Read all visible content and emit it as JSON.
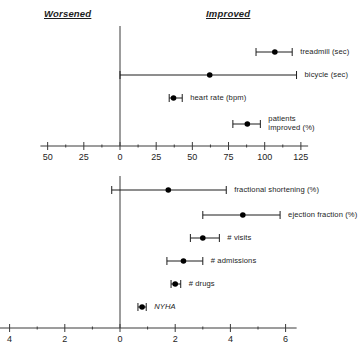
{
  "headers": {
    "worsened": "Worsened",
    "improved": "Improved"
  },
  "chart_data": [
    {
      "type": "scatter",
      "id": "top-panel",
      "title": "",
      "subtitle": "",
      "xlabel": "",
      "ylabel": "",
      "xlim": [
        -55,
        130
      ],
      "grid": false,
      "legend": "none",
      "annotations": [
        "Worsened",
        "Improved"
      ],
      "zero_reference_line": 0,
      "xticks": [
        -50,
        -25,
        0,
        25,
        50,
        75,
        100,
        125
      ],
      "xticklabels": [
        "50",
        "25",
        "0",
        "25",
        "50",
        "75",
        "100",
        "125"
      ],
      "xminorticks": [
        -37.5,
        -12.5,
        12.5,
        37.5,
        62.5,
        87.5,
        112.5
      ],
      "points": [
        {
          "label": "treadmill (sec)",
          "value": 107,
          "ci_low": 94,
          "ci_high": 119
        },
        {
          "label": "bicycle (sec)",
          "value": 62,
          "ci_low": 0,
          "ci_high": 122
        },
        {
          "label": "heart rate (bpm)",
          "value": 37,
          "ci_low": 34,
          "ci_high": 43
        },
        {
          "label": "patients\nimproved (%)",
          "value": 88,
          "ci_low": 78,
          "ci_high": 97
        }
      ]
    },
    {
      "type": "scatter",
      "id": "bottom-panel",
      "title": "",
      "subtitle": "",
      "xlabel": "",
      "ylabel": "",
      "xlim": [
        -4.4,
        6.4
      ],
      "grid": false,
      "legend": "none",
      "annotations": [],
      "zero_reference_line": 0,
      "xticks": [
        -4,
        -2,
        0,
        2,
        4,
        6
      ],
      "xticklabels": [
        "4",
        "2",
        "0",
        "2",
        "4",
        "6"
      ],
      "xminorticks": [
        -3,
        -1,
        1,
        3,
        5
      ],
      "points": [
        {
          "label": "fractional shortening (%)",
          "value": 1.75,
          "ci_low": -0.3,
          "ci_high": 3.85
        },
        {
          "label": "ejection fraction (%)",
          "value": 4.45,
          "ci_low": 3.0,
          "ci_high": 5.8
        },
        {
          "label": "# visits",
          "value": 3.0,
          "ci_low": 2.55,
          "ci_high": 3.6
        },
        {
          "label": "# admissions",
          "value": 2.3,
          "ci_low": 1.7,
          "ci_high": 3.0
        },
        {
          "label": "# drugs",
          "value": 2.0,
          "ci_low": 1.85,
          "ci_high": 2.2
        },
        {
          "label": "NYHA",
          "value": 0.8,
          "ci_low": 0.65,
          "ci_high": 0.95,
          "italic": true
        }
      ]
    }
  ],
  "colors": {
    "ink": "#1d1d1d",
    "axis": "#3a3a3a",
    "marker": "#000000",
    "background": "#ffffff"
  }
}
